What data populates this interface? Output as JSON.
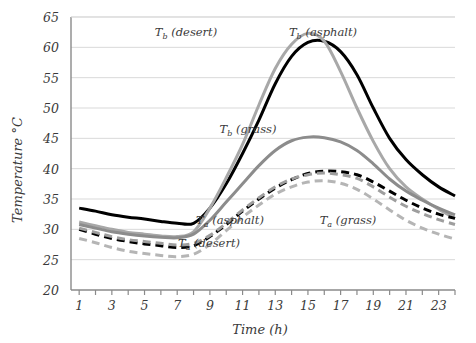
{
  "chart_data": {
    "type": "line",
    "title": "",
    "xlabel": "Time (h)",
    "ylabel": "Temperature °C",
    "xlim": [
      0.5,
      24.0
    ],
    "ylim": [
      20,
      65
    ],
    "grid": true,
    "grid_axis": "y",
    "legend_position": "inline-annotations",
    "x": [
      1,
      2,
      3,
      4,
      5,
      6,
      7,
      8,
      9,
      10,
      11,
      12,
      13,
      14,
      15,
      16,
      17,
      18,
      19,
      20,
      21,
      22,
      23,
      24
    ],
    "xticks": [
      1,
      2,
      3,
      4,
      5,
      6,
      7,
      8,
      9,
      10,
      11,
      12,
      13,
      14,
      15,
      16,
      17,
      18,
      19,
      20,
      21,
      22,
      23,
      24
    ],
    "xtick_labels": [
      "1",
      "",
      "3",
      "",
      "5",
      "",
      "7",
      "",
      "9",
      "",
      "11",
      "",
      "13",
      "",
      "15",
      "",
      "17",
      "",
      "19",
      "",
      "21",
      "",
      "23",
      ""
    ],
    "yticks": [
      20,
      25,
      30,
      35,
      40,
      45,
      50,
      55,
      60,
      65
    ],
    "ytick_labels": [
      "20",
      "25",
      "30",
      "35",
      "40",
      "45",
      "50",
      "55",
      "60",
      "65"
    ],
    "series": [
      {
        "name": "Tb (asphalt)",
        "label_text": "T",
        "label_sub": "b",
        "label_rest": " (asphalt)",
        "style": "solid",
        "color": "#000000",
        "width": 3.0,
        "values": [
          33.5,
          33.0,
          32.4,
          32.0,
          31.7,
          31.3,
          31.0,
          31.0,
          33.5,
          37.5,
          42.5,
          48.0,
          54.0,
          58.5,
          60.8,
          61.0,
          59.3,
          55.5,
          50.0,
          45.0,
          41.5,
          39.0,
          37.0,
          35.5
        ]
      },
      {
        "name": "Tb (desert)",
        "label_text": "T",
        "label_sub": "b",
        "label_rest": " (desert)",
        "style": "solid",
        "color": "#a8a8a8",
        "width": 3.0,
        "values": [
          31.2,
          30.6,
          30.0,
          29.5,
          29.2,
          28.9,
          28.8,
          29.6,
          33.5,
          38.5,
          44.0,
          50.5,
          56.5,
          60.5,
          62.3,
          61.0,
          56.0,
          50.0,
          44.5,
          40.0,
          37.0,
          35.0,
          33.3,
          31.8
        ]
      },
      {
        "name": "Tb (grass)",
        "label_text": "T",
        "label_sub": "b",
        "label_rest": " (grass)",
        "style": "solid",
        "color": "#8c8c8c",
        "width": 3.0,
        "values": [
          30.8,
          30.2,
          29.6,
          29.2,
          28.9,
          28.7,
          28.6,
          29.2,
          31.5,
          34.5,
          37.5,
          40.5,
          43.0,
          44.6,
          45.2,
          45.1,
          44.4,
          43.0,
          40.8,
          38.3,
          36.3,
          34.8,
          33.5,
          32.4
        ]
      },
      {
        "name": "Ta (asphalt)",
        "label_text": "T",
        "label_sub": "a",
        "label_rest": " (asphalt)",
        "style": "dashed",
        "color": "#000000",
        "width": 3.0,
        "values": [
          30.0,
          29.2,
          28.5,
          28.0,
          27.6,
          27.3,
          27.0,
          27.3,
          28.8,
          30.8,
          33.0,
          35.0,
          36.8,
          38.2,
          39.2,
          39.6,
          39.5,
          39.0,
          37.8,
          36.3,
          34.8,
          33.5,
          32.5,
          31.8
        ]
      },
      {
        "name": "Ta (desert)",
        "label_text": "T",
        "label_sub": "a",
        "label_rest": " (desert)",
        "style": "dashed",
        "color": "#9e9e9e",
        "width": 3.0,
        "values": [
          30.2,
          29.5,
          28.8,
          28.3,
          28.0,
          27.7,
          27.4,
          27.7,
          29.0,
          31.0,
          33.2,
          35.2,
          37.0,
          38.3,
          39.0,
          39.3,
          39.0,
          38.4,
          37.0,
          35.3,
          33.8,
          32.6,
          31.6,
          30.8
        ]
      },
      {
        "name": "Ta (grass)",
        "label_text": "T",
        "label_sub": "a",
        "label_rest": " (grass)",
        "style": "dashed",
        "color": "#b5b5b5",
        "width": 3.0,
        "values": [
          28.5,
          27.8,
          27.0,
          26.4,
          26.0,
          25.7,
          25.5,
          25.9,
          27.5,
          29.8,
          32.0,
          34.0,
          35.8,
          37.0,
          37.8,
          38.0,
          37.6,
          36.6,
          35.0,
          33.2,
          31.5,
          30.2,
          29.2,
          28.4
        ]
      }
    ],
    "annotations": [
      {
        "text": "Tb (desert)",
        "t": "T",
        "sub": "b",
        "rest": " (desert)",
        "x_px": 186,
        "y_px": 36
      },
      {
        "text": "Tb (asphalt)",
        "t": "T",
        "sub": "b",
        "rest": " (asphalt)",
        "x_px": 323,
        "y_px": 36
      },
      {
        "text": "Tb (grass)",
        "t": "T",
        "sub": "b",
        "rest": " (grass)",
        "x_px": 248,
        "y_px": 133
      },
      {
        "text": "Ta (asphalt)",
        "t": "T",
        "sub": "a",
        "rest": " (asphalt)",
        "x_px": 230,
        "y_px": 224
      },
      {
        "text": "Ta (desert)",
        "t": "T",
        "sub": "a",
        "rest": " (desert)",
        "x_px": 209,
        "y_px": 247
      },
      {
        "text": "Ta (grass)",
        "t": "T",
        "sub": "a",
        "rest": " (grass)",
        "x_px": 348,
        "y_px": 224
      }
    ],
    "colors": {
      "axis": "#8a8a8a",
      "grid": "#d9d9d9",
      "text": "#3a3a3a",
      "background": "#ffffff"
    }
  }
}
